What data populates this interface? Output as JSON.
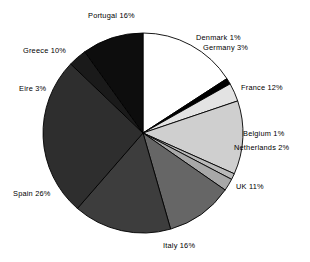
{
  "chart_data": {
    "type": "pie",
    "title": "",
    "subtitle": "",
    "xlabel": "",
    "ylabel": "",
    "legend_position": "none",
    "grid": false,
    "unit": "%",
    "labels_show_value": true,
    "total_percent": 101,
    "center": {
      "x": 143,
      "y": 133
    },
    "radius": 100,
    "start_angle_deg": -90,
    "direction": "clockwise",
    "categories": [
      "Portugal",
      "Denmark",
      "Germany",
      "France",
      "Belgium",
      "Netherlands",
      "UK",
      "Italy",
      "Spain",
      "Eire",
      "Greece"
    ],
    "values": [
      16,
      1,
      3,
      12,
      1,
      2,
      11,
      16,
      26,
      3,
      10
    ],
    "slices": [
      {
        "name": "Portugal",
        "value": 16,
        "label": "Portugal 16%",
        "color": "#ffffff"
      },
      {
        "name": "Denmark",
        "value": 1,
        "label": "Denmark 1%",
        "color": "#000000"
      },
      {
        "name": "Germany",
        "value": 3,
        "label": "Germany 3%",
        "color": "#e3e3e3"
      },
      {
        "name": "France",
        "value": 12,
        "label": "France 12%",
        "color": "#cfcfcf"
      },
      {
        "name": "Belgium",
        "value": 1,
        "label": "Belgium 1%",
        "color": "#b9b9b9"
      },
      {
        "name": "Netherlands",
        "value": 2,
        "label": "Netherlands 2%",
        "color": "#a8a8a8"
      },
      {
        "name": "UK",
        "value": 11,
        "label": "UK 11%",
        "color": "#666666"
      },
      {
        "name": "Italy",
        "value": 16,
        "label": "Italy 16%",
        "color": "#3d3d3d"
      },
      {
        "name": "Spain",
        "value": 26,
        "label": "Spain 26%",
        "color": "#2e2e2e"
      },
      {
        "name": "Eire",
        "value": 3,
        "label": "Eire 3%",
        "color": "#1a1a1a"
      },
      {
        "name": "Greece",
        "value": 10,
        "label": "Greece 10%",
        "color": "#0d0d0d"
      }
    ],
    "outline_color": "#000000"
  },
  "labels": {
    "portugal": "Portugal 16%",
    "denmark": "Denmark 1%",
    "germany": "Germany 3%",
    "france": "France 12%",
    "belgium": "Belgium 1%",
    "netherlands": "Netherlands 2%",
    "uk": "UK 11%",
    "italy": "Italy 16%",
    "spain": "Spain 26%",
    "eire": "Eire 3%",
    "greece": "Greece 10%"
  }
}
